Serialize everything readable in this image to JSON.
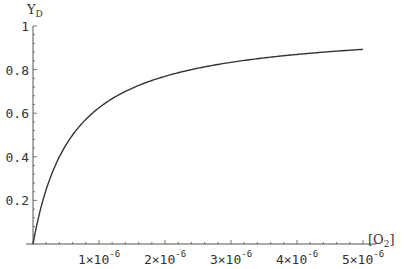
{
  "chart_data": {
    "type": "line",
    "title": "",
    "xlabel": "[O2]",
    "xlabel_main": "[O",
    "xlabel_sub": "2",
    "xlabel_close": "]",
    "ylabel": "YD",
    "ylabel_main": "Y",
    "ylabel_sub": "D",
    "xlim": [
      0,
      5.2e-06
    ],
    "ylim": [
      0,
      1
    ],
    "x_ticks": [
      {
        "value": 1e-06,
        "mantissa": "1",
        "exponent": "-6"
      },
      {
        "value": 2e-06,
        "mantissa": "2",
        "exponent": "-6"
      },
      {
        "value": 3e-06,
        "mantissa": "3",
        "exponent": "-6"
      },
      {
        "value": 4e-06,
        "mantissa": "4",
        "exponent": "-6"
      },
      {
        "value": 5e-06,
        "mantissa": "5",
        "exponent": "-6"
      }
    ],
    "x_minor_per_major": 5,
    "y_ticks": [
      {
        "value": 0.2,
        "label": "0.2"
      },
      {
        "value": 0.4,
        "label": "0.4"
      },
      {
        "value": 0.6,
        "label": "0.6"
      },
      {
        "value": 0.8,
        "label": "0.8"
      },
      {
        "value": 1.0,
        "label": "1"
      }
    ],
    "y_minor_per_major": 5,
    "grid": false,
    "legend": "none",
    "series": [
      {
        "name": "YD",
        "function": "x/(K+x)",
        "K": 6e-07,
        "x_range": [
          0,
          5e-06
        ],
        "samples": [
          [
            0,
            0
          ],
          [
            2.5e-07,
            0.294
          ],
          [
            5e-07,
            0.455
          ],
          [
            1e-06,
            0.625
          ],
          [
            1.5e-06,
            0.714
          ],
          [
            2e-06,
            0.769
          ],
          [
            2.5e-06,
            0.806
          ],
          [
            3e-06,
            0.833
          ],
          [
            3.5e-06,
            0.854
          ],
          [
            4e-06,
            0.87
          ],
          [
            4.5e-06,
            0.882
          ],
          [
            5e-06,
            0.893
          ]
        ],
        "color": "#333333"
      }
    ]
  }
}
